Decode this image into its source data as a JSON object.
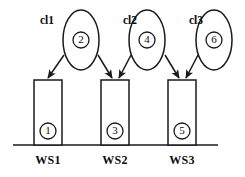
{
  "diagram": {
    "type": "workstation-cluster-assignment-diagram",
    "baseline": {
      "x1": 13,
      "x2": 218,
      "y": 145
    },
    "clusters": [
      {
        "label": "cl1",
        "label_x": 47,
        "label_y": 21,
        "ellipse": {
          "cx": 81,
          "cy": 40,
          "rx": 18,
          "ry": 30
        },
        "node": "2"
      },
      {
        "label": "cl2",
        "label_x": 130,
        "label_y": 21,
        "ellipse": {
          "cx": 147,
          "cy": 40,
          "rx": 18,
          "ry": 30
        },
        "node": "4"
      },
      {
        "label": "cl3",
        "label_x": 196,
        "label_y": 21,
        "ellipse": {
          "cx": 214,
          "cy": 40,
          "rx": 18,
          "ry": 30
        },
        "node": "6"
      }
    ],
    "ellipse_nodes": [
      {
        "id": "2",
        "cx": 81,
        "cy": 40,
        "r": 8
      },
      {
        "id": "4",
        "cx": 147,
        "cy": 40,
        "r": 8
      },
      {
        "id": "6",
        "cx": 214,
        "cy": 40,
        "r": 8
      }
    ],
    "workstations": [
      {
        "label": "WS1",
        "rect": {
          "x": 34,
          "y": 80,
          "w": 28,
          "h": 65
        },
        "node": "1",
        "node_cx": 48,
        "node_cy": 131,
        "label_x": 48,
        "label_y": 161
      },
      {
        "label": "WS2",
        "rect": {
          "x": 101,
          "y": 80,
          "w": 28,
          "h": 65
        },
        "node": "3",
        "node_cx": 115,
        "node_cy": 131,
        "label_x": 115,
        "label_y": 161
      },
      {
        "label": "WS3",
        "rect": {
          "x": 168,
          "y": 80,
          "w": 28,
          "h": 65
        },
        "node": "5",
        "node_cx": 182,
        "node_cy": 131,
        "label_x": 182,
        "label_y": 161
      }
    ],
    "rect_nodes": [
      {
        "id": "1",
        "cx": 48,
        "cy": 131,
        "r": 8
      },
      {
        "id": "3",
        "cx": 115,
        "cy": 131,
        "r": 8
      },
      {
        "id": "5",
        "cx": 182,
        "cy": 131,
        "r": 8
      }
    ],
    "arrows": [
      {
        "name": "arrow-cl1-to-ws1",
        "x1": 64,
        "y1": 55,
        "x2": 48,
        "y2": 78
      },
      {
        "name": "arrow-ws2-left",
        "x1": 98,
        "y1": 55,
        "x2": 112,
        "y2": 78
      },
      {
        "name": "arrow-cl2-to-ws2",
        "x1": 131,
        "y1": 55,
        "x2": 119,
        "y2": 78
      },
      {
        "name": "arrow-ws3-left",
        "x1": 165,
        "y1": 55,
        "x2": 179,
        "y2": 78
      },
      {
        "name": "arrow-cl3-to-ws3",
        "x1": 198,
        "y1": 55,
        "x2": 186,
        "y2": 78
      }
    ],
    "colors": {
      "stroke": "#1a1a1a",
      "text": "#0d0d0d",
      "background": "#ffffff"
    }
  }
}
